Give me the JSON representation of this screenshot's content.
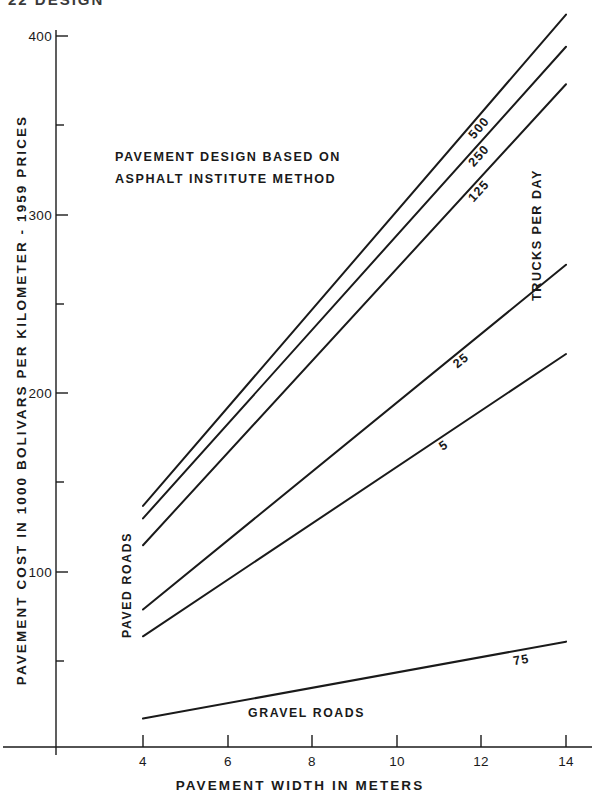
{
  "header": {
    "page_text": "22  DESIGN"
  },
  "chart_data": {
    "type": "line",
    "title": "",
    "annotation_lines": [
      "PAVEMENT DESIGN BASED ON",
      "ASPHALT INSTITUTE METHOD"
    ],
    "xlabel": "PAVEMENT WIDTH IN METERS",
    "ylabel": "PAVEMENT COST IN 1000 BOLIVARS PER KILOMETER - 1959 PRICES",
    "legend_title": "TRUCKS PER DAY",
    "group_labels": {
      "paved": "PAVED ROADS",
      "gravel": "GRAVEL ROADS"
    },
    "xlim": [
      3.2,
      14.6
    ],
    "ylim": [
      0,
      420
    ],
    "xticks": [
      4,
      6,
      8,
      10,
      12,
      14
    ],
    "xticklabels": [
      "4",
      "6",
      "8",
      "10",
      "12",
      "14"
    ],
    "yticks": [
      100,
      200,
      300,
      400
    ],
    "yticklabels": [
      "100",
      "200",
      "300",
      "400"
    ],
    "yminorticks": [
      50,
      150,
      250,
      350
    ],
    "grid": false,
    "legend_position": "inline-right",
    "x": [
      4,
      14
    ],
    "series": [
      {
        "name": "500",
        "label": "500",
        "group": "paved",
        "values": [
          137,
          412
        ]
      },
      {
        "name": "250",
        "label": "250",
        "group": "paved",
        "values": [
          130,
          394
        ]
      },
      {
        "name": "125",
        "label": "125",
        "group": "paved",
        "values": [
          115,
          373
        ]
      },
      {
        "name": "25",
        "label": "25",
        "group": "paved",
        "values": [
          79,
          272
        ]
      },
      {
        "name": "5",
        "label": "5",
        "group": "paved",
        "values": [
          64,
          222
        ]
      },
      {
        "name": "75",
        "label": "75",
        "group": "gravel",
        "values": [
          18,
          61
        ]
      }
    ]
  }
}
